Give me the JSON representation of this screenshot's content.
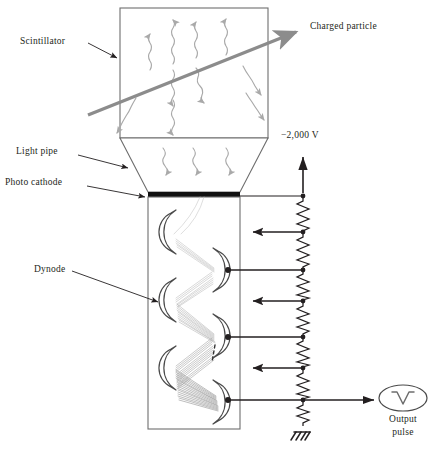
{
  "figure": {
    "type": "diagram",
    "background_color": "#ffffff",
    "ink_color": "#231f20",
    "photon_color": "#a9a9a9",
    "track_color": "#8c8c8c",
    "electron_color": "#b5b5b5",
    "cathode_color": "#111111"
  },
  "labels": {
    "scintillator": "Scintillator",
    "light_pipe": "Light pipe",
    "photo_cathode": "Photo cathode",
    "dynode": "Dynode",
    "charged_particle": "Charged particle",
    "supply_voltage": "−2,000 V",
    "output_line1": "Output",
    "output_line2": "pulse"
  },
  "components": {
    "scintillator_box": {
      "x": 120,
      "y": 8,
      "w": 148,
      "h": 130
    },
    "light_pipe": {
      "top_y": 138,
      "bottom_y": 192,
      "top_left": 120,
      "top_right": 268,
      "bottom_left": 148,
      "bottom_right": 240
    },
    "photo_cathode_bar": {
      "x": 148,
      "y": 192,
      "w": 92,
      "h": 5
    },
    "pmt_body": {
      "x": 148,
      "y": 197,
      "w": 92,
      "h": 232
    },
    "divider_chain": {
      "x": 303,
      "top_y": 160,
      "bottom_y": 430
    },
    "ground_symbol": {
      "x": 303,
      "y": 424
    },
    "output_scope": {
      "cx": 403,
      "cy": 398,
      "rx": 24,
      "ry": 13
    }
  },
  "dynodes": [
    {
      "index": 1,
      "side": "left",
      "cx": 170,
      "cy": 232,
      "tap": false
    },
    {
      "index": 2,
      "side": "right",
      "cx": 218,
      "cy": 270,
      "tap": true
    },
    {
      "index": 3,
      "side": "left",
      "cx": 170,
      "cy": 300,
      "tap": false
    },
    {
      "index": 4,
      "side": "right",
      "cx": 218,
      "cy": 336,
      "tap": true
    },
    {
      "index": 5,
      "side": "left",
      "cx": 170,
      "cy": 368,
      "tap": false
    },
    {
      "index": 6,
      "side": "right",
      "cx": 218,
      "cy": 400,
      "tap": true
    }
  ],
  "divider_taps": [
    {
      "y": 197,
      "kind": "cathode-wire"
    },
    {
      "y": 232,
      "kind": "arrow-left"
    },
    {
      "y": 270,
      "kind": "lead-to-dynode"
    },
    {
      "y": 300,
      "kind": "arrow-left"
    },
    {
      "y": 336,
      "kind": "lead-to-dynode"
    },
    {
      "y": 368,
      "kind": "arrow-left"
    },
    {
      "y": 400,
      "kind": "lead-to-anode-and-output"
    }
  ],
  "resistor_count": 7,
  "annotations": {
    "charged_particle_track": {
      "x1": 88,
      "y1": 115,
      "x2": 298,
      "y2": 31
    },
    "supply_arrow": {
      "x": 303,
      "y_tail": 192,
      "y_head": 158
    }
  }
}
